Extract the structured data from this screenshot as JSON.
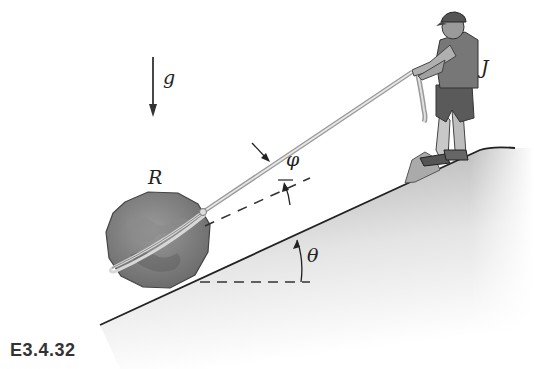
{
  "figure": {
    "caption": "E3.4.32",
    "labels": {
      "gravity": "g",
      "rock": "R",
      "person": "J",
      "rope_angle": "φ",
      "slope_angle": "θ"
    },
    "colors": {
      "line": "#222222",
      "rope": "#9a9a9a",
      "rock": "#7a7a7a",
      "slope_shade": "#b8b8b8"
    }
  }
}
